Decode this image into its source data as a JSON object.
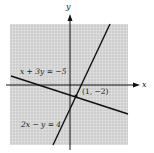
{
  "figure": {
    "axis_labels": {
      "x": "x",
      "y": "y"
    },
    "equations": [
      {
        "label": "x + 3y = −5",
        "slope": -0.3333,
        "intercept": -1.6667
      },
      {
        "label": "2x − y = 4",
        "slope": 2,
        "intercept": -4
      }
    ],
    "intersection": {
      "label": "(1, −2)",
      "x": 1,
      "y": -2
    },
    "grid": {
      "xmin": -10,
      "xmax": 10,
      "ymin": -10,
      "ymax": 10,
      "step": 0.5
    },
    "colors": {
      "grid_bg": "#cfcfcf",
      "grid_line": "#ffffff",
      "line": "#111111",
      "axis": "#111111"
    }
  }
}
